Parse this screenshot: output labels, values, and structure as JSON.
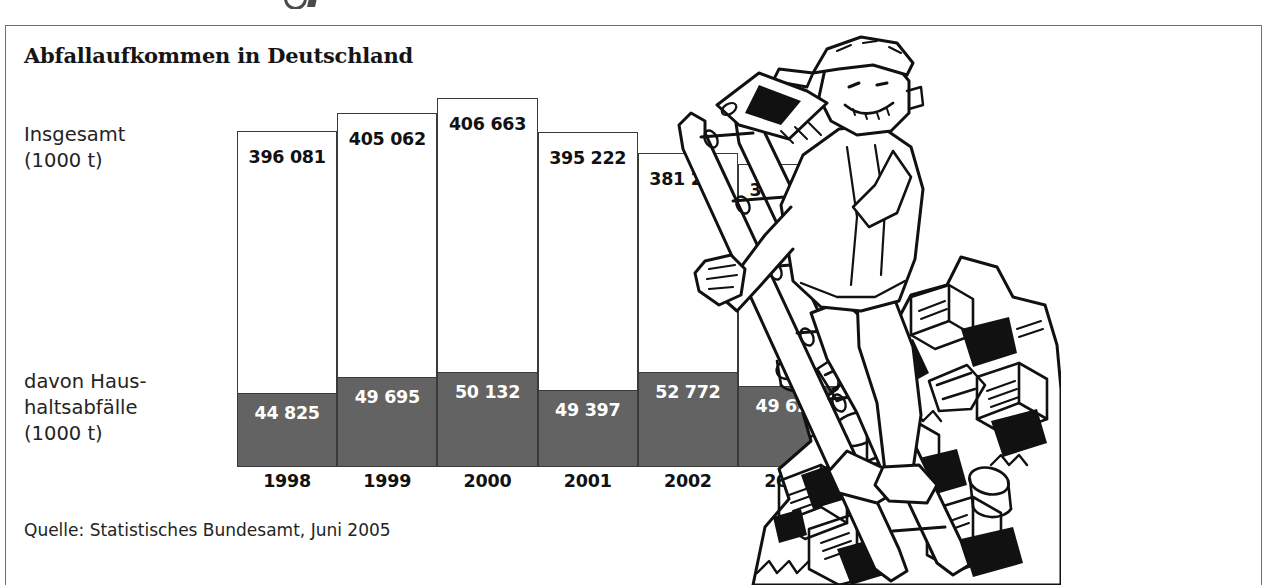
{
  "frame": {
    "title": "Abfallaufkommen in Deutschland",
    "source": "Quelle: Statistisches Bundesamt, Juni 2005",
    "border_color": "#6e6e72"
  },
  "labels": {
    "total": "Insgesamt\n(1000 t)",
    "household": "davon Haus-\nhaltsabfälle\n(1000 t)"
  },
  "illustration": {
    "name": "man-climbing-ladder-on-garbage-pile",
    "ink_color": "#111111"
  },
  "chart_data": {
    "type": "bar",
    "title": "Abfallaufkommen in Deutschland",
    "subtitle": "",
    "xlabel": "",
    "ylabel": "1000 t",
    "stacked": true,
    "grid": false,
    "legend_position": "left-axis-labels",
    "ylim": [
      0,
      430000
    ],
    "categories": [
      "1998",
      "1999",
      "2000",
      "2001",
      "2002",
      "2003"
    ],
    "series": [
      {
        "name": "Insgesamt (1000 t)",
        "color": "#ffffff",
        "outline": "#3a3a3a",
        "values": [
          396081,
          405062,
          406663,
          395222,
          381262,
          366412
        ],
        "labels": [
          "396 081",
          "405 062",
          "406 663",
          "395 222",
          "381 262",
          "366 412"
        ]
      },
      {
        "name": "davon Haushaltsabfälle (1000 t)",
        "color": "#636363",
        "outline": "#3a3a3a",
        "values": [
          44825,
          49695,
          50132,
          49397,
          52772,
          49622
        ],
        "labels": [
          "44 825",
          "49 695",
          "50 132",
          "49 397",
          "52 772",
          "49 622"
        ]
      }
    ],
    "bar_top_px": [
      130,
      112,
      97,
      131,
      152,
      163
    ],
    "gray_top_px": [
      392,
      376,
      371,
      389,
      371,
      385
    ],
    "baseline_px": 466,
    "source": "Quelle: Statistisches Bundesamt, Juni 2005"
  }
}
